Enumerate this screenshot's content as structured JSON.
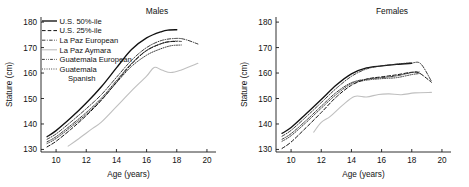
{
  "figure": {
    "background": "#ffffff",
    "panels": [
      "Males",
      "Females"
    ]
  },
  "axes": {
    "xlabel": "Age (years)",
    "ylabel": "Stature (cm)",
    "xticks": [
      "10",
      "12",
      "14",
      "16",
      "18",
      "20"
    ],
    "yticks": [
      "130",
      "140",
      "150",
      "160",
      "170",
      "180"
    ],
    "xlim": [
      9,
      20.6
    ],
    "ylim": [
      129,
      182
    ]
  },
  "legend": {
    "entries": [
      {
        "label": "U.S. 50%-ile",
        "style": "solid",
        "color": "#111111",
        "width": 1.35
      },
      {
        "label": "U.S. 25%-ile",
        "style": "dashed",
        "color": "#111111",
        "width": 1.0
      },
      {
        "label": "La Paz European",
        "style": "dashdot",
        "color": "#333333",
        "width": 0.95
      },
      {
        "label": "La Paz Aymara",
        "style": "solid",
        "color": "#bfbfbf",
        "width": 1.1
      },
      {
        "label": "Guatemala European",
        "style": "dashdotdot",
        "color": "#222222",
        "width": 0.9
      },
      {
        "label": "Guatemala Spanish",
        "style": "dotted",
        "color": "#222222",
        "width": 0.9
      }
    ],
    "wrapped_last": [
      "Guatemala",
      "Spanish"
    ]
  },
  "titles": {
    "males": "Males",
    "females": "Females"
  },
  "chart_data": {
    "type": "line",
    "xlabel": "Age (years)",
    "ylabel": "Stature (cm)",
    "xlim": [
      9,
      20.6
    ],
    "ylim": [
      129,
      182
    ],
    "grid": false,
    "legend_position": "upper-left (Males panel)",
    "panels": [
      {
        "name": "Males",
        "series": [
          {
            "name": "U.S. 50%-ile",
            "x": [
              9.4,
              10,
              11,
              12,
              13,
              14,
              15,
              16,
              17,
              17.5,
              18
            ],
            "y": [
              135.0,
              137.4,
              142.5,
              148.2,
              154.6,
              162.0,
              169.2,
              173.8,
              176.3,
              176.9,
              177.0
            ]
          },
          {
            "name": "U.S. 25%-ile",
            "x": [
              9.4,
              10,
              11,
              12,
              13,
              14,
              15,
              16,
              17,
              17.5,
              18
            ],
            "y": [
              131.0,
              133.2,
              138.0,
              143.3,
              149.3,
              156.4,
              163.5,
              168.8,
              171.6,
              172.3,
              172.4
            ]
          },
          {
            "name": "La Paz European",
            "x": [
              9.4,
              10,
              11,
              12,
              13,
              14,
              15,
              16,
              17,
              18,
              18.6,
              19.4
            ],
            "y": [
              134.0,
              136.1,
              140.9,
              146.0,
              151.5,
              158.3,
              165.0,
              170.0,
              172.8,
              173.6,
              173.1,
              171.4
            ]
          },
          {
            "name": "La Paz Aymara",
            "x": [
              10.8,
              11.5,
              12.4,
              13,
              14,
              15,
              16,
              16.5,
              17,
              17.6,
              18.3,
              19.4
            ],
            "y": [
              131.3,
              134.2,
              138.2,
              140.7,
              146.8,
              153.0,
              158.8,
              162.2,
              161.2,
              160.2,
              161.2,
              163.8
            ]
          },
          {
            "name": "Guatemala European",
            "x": [
              9.4,
              10,
              11,
              12,
              13,
              14,
              15,
              16,
              17,
              17.8,
              18.3
            ],
            "y": [
              133.0,
              135.0,
              139.6,
              144.5,
              150.1,
              157.0,
              163.8,
              168.9,
              171.6,
              172.5,
              172.4
            ]
          },
          {
            "name": "Guatemala Spanish",
            "x": [
              9.4,
              10,
              11,
              12,
              13,
              14,
              15,
              16,
              16.8,
              17.6,
              18.3
            ],
            "y": [
              132.3,
              134.3,
              138.9,
              143.8,
              149.5,
              156.2,
              162.6,
              167.0,
              169.2,
              170.7,
              171.0
            ]
          }
        ]
      },
      {
        "name": "Females",
        "series": [
          {
            "name": "U.S. 50%-ile",
            "x": [
              9.4,
              10,
              11,
              12,
              13,
              14,
              15,
              16,
              17,
              18
            ],
            "y": [
              136.3,
              138.6,
              144.0,
              149.6,
              155.3,
              159.7,
              162.0,
              162.8,
              163.4,
              163.8
            ]
          },
          {
            "name": "U.S. 25%-ile",
            "x": [
              9.4,
              10,
              11,
              12,
              13,
              14,
              15,
              16,
              17,
              18,
              18.5,
              19.3
            ],
            "y": [
              130.4,
              132.9,
              138.6,
              144.5,
              150.6,
              155.2,
              157.6,
              158.5,
              159.3,
              160.3,
              160.0,
              156.4
            ]
          },
          {
            "name": "La Paz European",
            "x": [
              9.4,
              10,
              11,
              12,
              13,
              14,
              15,
              16,
              17,
              18,
              18.6,
              19.3
            ],
            "y": [
              135.2,
              137.5,
              142.8,
              148.4,
              154.0,
              158.7,
              161.6,
              162.8,
              163.5,
              164.0,
              163.6,
              156.8
            ]
          },
          {
            "name": "La Paz Aymara",
            "x": [
              11.5,
              12,
              12.6,
              13.4,
              14.2,
              15,
              15.8,
              16.5,
              17.3,
              18.2,
              19.3
            ],
            "y": [
              136.8,
              140.6,
              143.0,
              147.3,
              150.8,
              150.6,
              151.6,
              151.8,
              151.5,
              152.2,
              152.4
            ]
          },
          {
            "name": "Guatemala European",
            "x": [
              9.4,
              10,
              11,
              12,
              13,
              14,
              15,
              16,
              17,
              18,
              18.5
            ],
            "y": [
              134.0,
              136.2,
              141.4,
              147.0,
              152.4,
              156.2,
              157.6,
              158.2,
              158.9,
              160.2,
              160.4
            ]
          },
          {
            "name": "Guatemala Spanish",
            "x": [
              9.4,
              10,
              11,
              12,
              13,
              14,
              15,
              16,
              17,
              18,
              18.5
            ],
            "y": [
              133.2,
              135.4,
              140.6,
              146.2,
              151.6,
              155.8,
              157.2,
              157.8,
              158.2,
              159.4,
              159.8
            ]
          }
        ]
      }
    ]
  }
}
